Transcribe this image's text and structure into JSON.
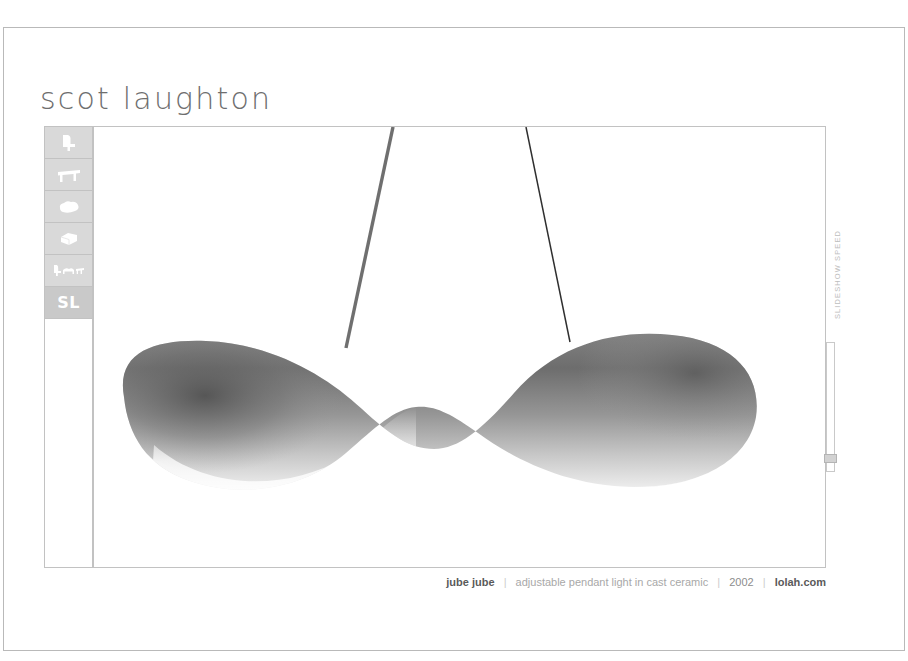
{
  "window": {
    "background_color": "#ffffff",
    "frame_border_color": "#b9b9b9"
  },
  "header": {
    "brand_title": "scot laughton"
  },
  "sidebar": {
    "items": [
      {
        "id": "chair",
        "icon": "chair-icon",
        "label": "",
        "active": false
      },
      {
        "id": "table",
        "icon": "table-icon",
        "label": "",
        "active": false
      },
      {
        "id": "blob",
        "icon": "cloud-blob-icon",
        "label": "",
        "active": false
      },
      {
        "id": "box",
        "icon": "box-icon",
        "label": "",
        "active": false
      },
      {
        "id": "collection",
        "icon": "furniture-group-icon",
        "label": "",
        "active": false
      },
      {
        "id": "sl",
        "icon": "sl-monogram-icon",
        "label": "SL",
        "active": true
      }
    ]
  },
  "stage": {
    "image_alt": "jube jube pendant light",
    "lamp_color_top": "#5d5d5d",
    "lamp_color_mid": "#9a9a9a",
    "lamp_color_bottom": "#f4f4f4",
    "cord_color_left": "#6f6f6f",
    "cord_color_right": "#2c2c2c"
  },
  "speed_control": {
    "label": "SLIDESHOW SPEED",
    "value_percent": 86,
    "track_color": "#c9c9c9",
    "handle_color": "#d2d2d2"
  },
  "caption": {
    "product": "jube jube",
    "separator": "|",
    "description": "adjustable pendant light in cast ceramic",
    "year": "2002",
    "site": "lolah.com"
  }
}
